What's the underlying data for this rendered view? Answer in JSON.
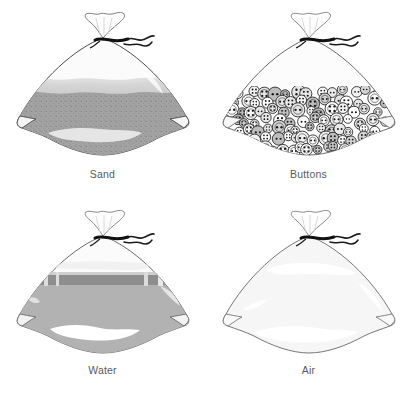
{
  "figure": {
    "layout": "2x2 grid of line-art illustrations",
    "background_color": "#ffffff",
    "caption_color": "#5a5a5a"
  },
  "cells": [
    {
      "id": "sand",
      "label": "Sand",
      "content_icon": "sand-bag-icon",
      "fill_color": "#a3a3a3",
      "fill_texture": "speckled granular",
      "fill_level_percent": 62,
      "bag_outline_color": "#4a4a4a",
      "bag_body_color": "#fbfbfb",
      "tie_color": "#111111",
      "highlight_color": "#ededed",
      "surface_band_color": "#d6d6d6"
    },
    {
      "id": "buttons",
      "label": "Buttons",
      "content_icon": "buttons-bag-icon",
      "fill_color": "#e8e8e8",
      "fill_texture": "overlapping round buttons with holes",
      "fill_level_percent": 55,
      "bag_outline_color": "#6a6a6a",
      "bag_body_color": "#fcfcfc",
      "tie_color": "#111111",
      "button_outline_color": "#2b2b2b",
      "button_hole_color": "#1a1a1a",
      "button_count": 96
    },
    {
      "id": "water",
      "label": "Water",
      "content_icon": "water-bag-icon",
      "fill_color": "#b2b2b2",
      "fill_texture": "smooth liquid with waterline",
      "fill_level_percent": 72,
      "bag_outline_color": "#6a6a6a",
      "bag_body_color": "#fbfbfb",
      "tie_color": "#111111",
      "waterline_color": "#8e8e8e",
      "highlight_color": "#ffffff"
    },
    {
      "id": "air",
      "label": "Air",
      "content_icon": "air-bag-icon",
      "fill_color": "#f4f4f4",
      "fill_texture": "empty / transparent",
      "fill_level_percent": 0,
      "bag_outline_color": "#777777",
      "bag_body_color": "#f6f6f6",
      "tie_color": "#111111",
      "highlight_color": "#ffffff"
    }
  ]
}
